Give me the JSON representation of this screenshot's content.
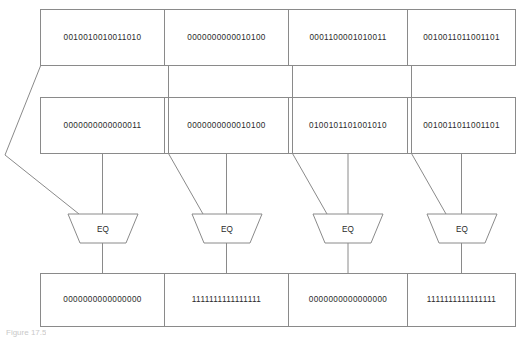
{
  "figure": {
    "caption": "Figure 17.5",
    "eq_label": "EQ",
    "colors": {
      "stroke": "#8a8a8a",
      "text": "#2b2b2b",
      "background": "#ffffff",
      "caption": "#c9c9c9"
    }
  },
  "rows": [
    {
      "name": "operand-row-a",
      "cells": [
        "0010010010011010",
        "0000000000010100",
        "0001100001010011",
        "0010011011001101"
      ]
    },
    {
      "name": "operand-row-b",
      "cells": [
        "0000000000000011",
        "0000000000010100",
        "0100101101001010",
        "0010011011001101"
      ]
    },
    {
      "name": "result-row",
      "cells": [
        "0000000000000000",
        "1111111111111111",
        "0000000000000000",
        "1111111111111111"
      ]
    }
  ],
  "comparators": [
    {
      "name": "eq-comparator-1",
      "label": "EQ"
    },
    {
      "name": "eq-comparator-2",
      "label": "EQ"
    },
    {
      "name": "eq-comparator-3",
      "label": "EQ"
    },
    {
      "name": "eq-comparator-4",
      "label": "EQ"
    }
  ]
}
